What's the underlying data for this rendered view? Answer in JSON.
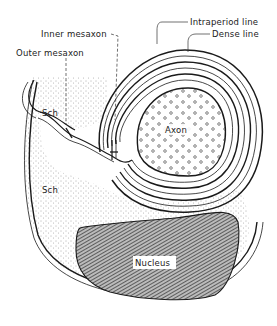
{
  "figure": {
    "type": "schematic of myelinated axon and Schwann cell",
    "labels": {
      "intraperiod_line": "Intraperiod line",
      "dense_line": "Dense line",
      "inner_mesaxon": "Inner mesaxon",
      "outer_mesaxon": "Outer mesaxon",
      "schwann_upper": "Sch",
      "schwann_lower": "Sch",
      "axon": "Axon",
      "nucleus": "Nucleus"
    },
    "colors": {
      "line": "#1a1a1a",
      "stipple": "#555555",
      "nucleus_hatch": "#333333",
      "background": "#ffffff"
    }
  }
}
